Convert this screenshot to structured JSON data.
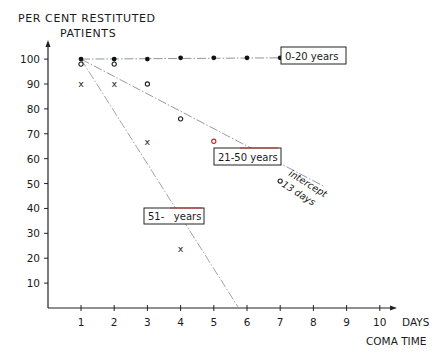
{
  "chart_data": {
    "type": "scatter",
    "title": "PER CENT RESTITUTED PATIENTS",
    "title_line1": "PER CENT RESTITUTED",
    "title_line2": "PATIENTS",
    "xlabel": "COMA TIME",
    "xunit": "DAYS",
    "ylabel": "PER CENT RESTITUTED PATIENTS",
    "xlim": [
      0,
      10.5
    ],
    "ylim": [
      0,
      105
    ],
    "grid": false,
    "x_ticks": [
      "1",
      "2",
      "3",
      "4",
      "5",
      "6",
      "7",
      "8",
      "9",
      "10"
    ],
    "y_ticks": [
      "10",
      "20",
      "30",
      "40",
      "50",
      "60",
      "70",
      "80",
      "90",
      "100"
    ],
    "series": [
      {
        "name": "0-20 years",
        "marker": "filled-dot",
        "x": [
          1,
          2,
          3,
          4,
          5,
          6,
          7
        ],
        "values": [
          100,
          100,
          100,
          100.5,
          100.5,
          100.5,
          100.5
        ],
        "fit_line": {
          "from": [
            1,
            100
          ],
          "to": [
            7,
            100.5
          ],
          "style": "dash-dot"
        }
      },
      {
        "name": "21-50 years",
        "marker": "open-circle",
        "x": [
          1,
          2,
          3,
          4,
          5,
          7
        ],
        "values": [
          98,
          98,
          90,
          76,
          67,
          51
        ],
        "fit_line": {
          "from": [
            1,
            100
          ],
          "to": [
            8.3,
            49
          ],
          "style": "dash-dot"
        }
      },
      {
        "name": "51- years",
        "marker": "x",
        "x": [
          1,
          2,
          3,
          4
        ],
        "values": [
          90,
          90,
          67,
          24
        ],
        "fit_line": {
          "from": [
            1,
            100
          ],
          "to": [
            5.75,
            0
          ],
          "style": "dash-dot"
        }
      }
    ],
    "annotations": [
      {
        "text": "intercept",
        "near": [
          7.6,
          50
        ]
      },
      {
        "text": "13 days",
        "near": [
          7.6,
          42
        ]
      }
    ],
    "legend_position": "inline-labels"
  },
  "labels": {
    "series0": "0-20 years",
    "series1": "21-50 years",
    "series2": "51-   years",
    "intercept": "intercept",
    "intercept_days": "13 days"
  }
}
